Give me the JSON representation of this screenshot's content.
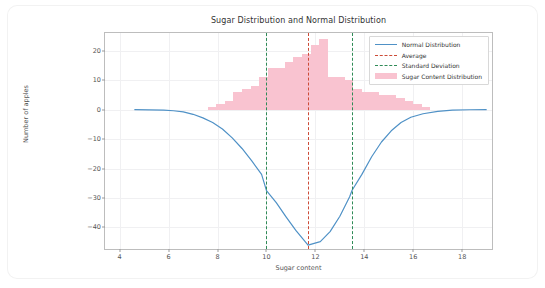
{
  "chart_data": {
    "type": "bar",
    "title": "Sugar Distribution and Normal Distribution",
    "xlabel": "Sugar content",
    "ylabel": "Number of apples",
    "xlim": [
      3.4,
      19.3
    ],
    "ylim": [
      -48,
      26
    ],
    "xticks": [
      4,
      6,
      8,
      10,
      12,
      14,
      16,
      18
    ],
    "yticks": [
      20,
      10,
      0,
      -10,
      -20,
      -30,
      -40
    ],
    "grid": true,
    "legend_position": "upper right",
    "legend": [
      {
        "label": "Normal Distribution",
        "style": "line",
        "color": "#4f91c6"
      },
      {
        "label": "Average",
        "style": "dashed",
        "color": "#cc4b37"
      },
      {
        "label": "Standard Deviation",
        "style": "dashed",
        "color": "#2f8b57"
      },
      {
        "label": "Sugar Content Distribution",
        "style": "patch",
        "color": "#f9c3d0"
      }
    ],
    "series": [
      {
        "name": "Sugar Content Distribution",
        "type": "bar",
        "color": "#f9c3d0",
        "bin_width": 0.35,
        "bins": [
          {
            "x": 7.6,
            "value": 1
          },
          {
            "x": 7.95,
            "value": 2
          },
          {
            "x": 8.3,
            "value": 3
          },
          {
            "x": 8.65,
            "value": 6
          },
          {
            "x": 9.0,
            "value": 7
          },
          {
            "x": 9.35,
            "value": 8
          },
          {
            "x": 9.7,
            "value": 11
          },
          {
            "x": 10.05,
            "value": 14
          },
          {
            "x": 10.4,
            "value": 14
          },
          {
            "x": 10.75,
            "value": 16
          },
          {
            "x": 11.1,
            "value": 18
          },
          {
            "x": 11.45,
            "value": 19
          },
          {
            "x": 11.8,
            "value": 22
          },
          {
            "x": 12.15,
            "value": 24
          },
          {
            "x": 12.5,
            "value": 11
          },
          {
            "x": 12.85,
            "value": 11
          },
          {
            "x": 13.2,
            "value": 10
          },
          {
            "x": 13.55,
            "value": 7
          },
          {
            "x": 13.9,
            "value": 6
          },
          {
            "x": 14.25,
            "value": 6
          },
          {
            "x": 14.6,
            "value": 5
          },
          {
            "x": 14.95,
            "value": 5
          },
          {
            "x": 15.3,
            "value": 4
          },
          {
            "x": 15.65,
            "value": 3
          },
          {
            "x": 16.0,
            "value": 2
          },
          {
            "x": 16.35,
            "value": 1
          }
        ]
      },
      {
        "name": "Normal Distribution",
        "type": "line",
        "color": "#4f91c6",
        "mean": 11.7,
        "min_value": -46,
        "points": [
          {
            "x": 4.6,
            "y": 0.0
          },
          {
            "x": 5.2,
            "y": -0.1
          },
          {
            "x": 5.8,
            "y": -0.2
          },
          {
            "x": 6.2,
            "y": -0.4
          },
          {
            "x": 6.6,
            "y": -0.8
          },
          {
            "x": 7.0,
            "y": -1.6
          },
          {
            "x": 7.4,
            "y": -2.8
          },
          {
            "x": 7.8,
            "y": -4.4
          },
          {
            "x": 8.2,
            "y": -6.6
          },
          {
            "x": 8.6,
            "y": -9.6
          },
          {
            "x": 9.0,
            "y": -13.2
          },
          {
            "x": 9.4,
            "y": -17.4
          },
          {
            "x": 9.8,
            "y": -22.0
          },
          {
            "x": 10.0,
            "y": -27.5
          },
          {
            "x": 10.4,
            "y": -31.6
          },
          {
            "x": 10.8,
            "y": -36.4
          },
          {
            "x": 11.2,
            "y": -41.0
          },
          {
            "x": 11.7,
            "y": -46.0
          },
          {
            "x": 12.2,
            "y": -44.8
          },
          {
            "x": 12.6,
            "y": -41.4
          },
          {
            "x": 13.0,
            "y": -36.2
          },
          {
            "x": 13.4,
            "y": -29.6
          },
          {
            "x": 13.5,
            "y": -27.4
          },
          {
            "x": 13.9,
            "y": -22.0
          },
          {
            "x": 14.3,
            "y": -16.0
          },
          {
            "x": 14.7,
            "y": -11.0
          },
          {
            "x": 15.1,
            "y": -7.2
          },
          {
            "x": 15.5,
            "y": -4.4
          },
          {
            "x": 15.9,
            "y": -2.6
          },
          {
            "x": 16.4,
            "y": -1.4
          },
          {
            "x": 17.0,
            "y": -0.6
          },
          {
            "x": 17.6,
            "y": -0.2
          },
          {
            "x": 18.3,
            "y": -0.05
          },
          {
            "x": 19.0,
            "y": 0.0
          }
        ]
      },
      {
        "name": "Average",
        "type": "vline",
        "color": "#cc4b37",
        "values": [
          11.7
        ]
      },
      {
        "name": "Standard Deviation",
        "type": "vline",
        "color": "#2f8b57",
        "values": [
          10.0,
          13.5
        ]
      }
    ]
  }
}
